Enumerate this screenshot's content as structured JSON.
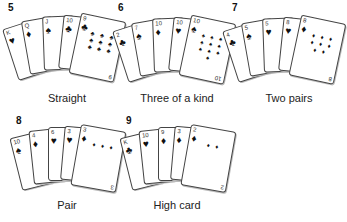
{
  "hands": [
    {
      "number": "5",
      "label": "Straight",
      "cards": [
        {
          "rank": "K",
          "suit": "♥"
        },
        {
          "rank": "Q",
          "suit": "♦"
        },
        {
          "rank": "J",
          "suit": "♠"
        },
        {
          "rank": "10",
          "suit": "♣"
        },
        {
          "rank": "9",
          "suit": "♣",
          "pips": "♣ ♣ ♣ ♣ ♣ ♣ ♣ ♣ ♣"
        }
      ]
    },
    {
      "number": "6",
      "label": "Three of a kind",
      "cards": [
        {
          "rank": "2",
          "suit": "♣"
        },
        {
          "rank": "7",
          "suit": "♠"
        },
        {
          "rank": "10",
          "suit": "♦"
        },
        {
          "rank": "10",
          "suit": "♥"
        },
        {
          "rank": "10",
          "suit": "♠",
          "pips": "♠ ♠ ♠ ♠ ♠ ♠ ♠ ♠ ♠ ♠"
        }
      ]
    },
    {
      "number": "7",
      "label": "Two pairs",
      "cards": [
        {
          "rank": "4",
          "suit": "♣"
        },
        {
          "rank": "5",
          "suit": "♠"
        },
        {
          "rank": "5",
          "suit": "♥"
        },
        {
          "rank": "8",
          "suit": "♥"
        },
        {
          "rank": "8",
          "suit": "♦",
          "pips": "♦ ♦ ♦ ♦ ♦ ♦ ♦ ♦"
        }
      ]
    },
    {
      "number": "8",
      "label": "Pair",
      "cards": [
        {
          "rank": "10",
          "suit": "♠"
        },
        {
          "rank": "4",
          "suit": "♦"
        },
        {
          "rank": "6",
          "suit": "♥"
        },
        {
          "rank": "3",
          "suit": "♥"
        },
        {
          "rank": "3",
          "suit": "♦",
          "pips": "♦ ♦ ♦"
        }
      ]
    },
    {
      "number": "9",
      "label": "High card",
      "cards": [
        {
          "rank": "K",
          "suit": "♣"
        },
        {
          "rank": "10",
          "suit": "♥"
        },
        {
          "rank": "9",
          "suit": "♦"
        },
        {
          "rank": "3",
          "suit": "♦"
        },
        {
          "rank": "2",
          "suit": "♦",
          "pips": "♦ ♦"
        }
      ]
    }
  ]
}
